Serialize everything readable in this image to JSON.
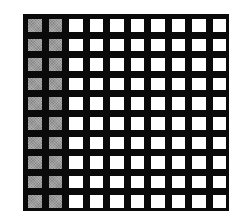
{
  "figure": {
    "type": "grid-diagram",
    "rows": 10,
    "columns": 10,
    "shaded_columns": 2,
    "shaded_count": 20,
    "total_count": 100,
    "colors": {
      "line": "#0a0a0a",
      "shaded": "#9a9a9a",
      "unshaded": "#ffffff",
      "background": "#ffffff"
    }
  }
}
